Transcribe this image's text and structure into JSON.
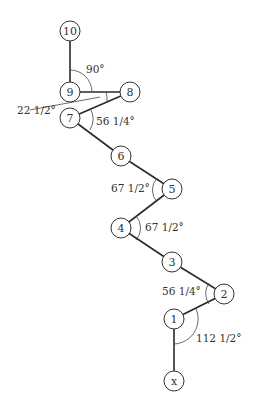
{
  "diagram": {
    "nodes": [
      {
        "id": "10",
        "label": "10",
        "x": 70,
        "y": 31
      },
      {
        "id": "9",
        "label": "9",
        "x": 70,
        "y": 92
      },
      {
        "id": "8",
        "label": "8",
        "x": 130,
        "y": 92
      },
      {
        "id": "7",
        "label": "7",
        "x": 70,
        "y": 118
      },
      {
        "id": "6",
        "label": "6",
        "x": 121,
        "y": 156
      },
      {
        "id": "5",
        "label": "5",
        "x": 172,
        "y": 189
      },
      {
        "id": "4",
        "label": "4",
        "x": 121,
        "y": 228
      },
      {
        "id": "3",
        "label": "3",
        "x": 172,
        "y": 262
      },
      {
        "id": "2",
        "label": "2",
        "x": 224,
        "y": 294
      },
      {
        "id": "1",
        "label": "1",
        "x": 174,
        "y": 319
      },
      {
        "id": "x",
        "label": "x",
        "x": 174,
        "y": 381
      }
    ],
    "edges": [
      [
        "x",
        "1"
      ],
      [
        "1",
        "2"
      ],
      [
        "2",
        "3"
      ],
      [
        "3",
        "4"
      ],
      [
        "4",
        "5"
      ],
      [
        "5",
        "6"
      ],
      [
        "6",
        "7"
      ],
      [
        "7",
        "8"
      ],
      [
        "8",
        "9"
      ],
      [
        "9",
        "10"
      ]
    ],
    "angles": [
      {
        "label": "90°",
        "x": 86,
        "y": 73
      },
      {
        "label": "22 1/2°",
        "x": 17,
        "y": 114
      },
      {
        "label": "56 1/4°",
        "x": 96,
        "y": 125
      },
      {
        "label": "67 1/2°",
        "x": 111,
        "y": 192
      },
      {
        "label": "67 1/2°",
        "x": 145,
        "y": 231
      },
      {
        "label": "56 1/4°",
        "x": 162,
        "y": 295
      },
      {
        "label": "112 1/2°",
        "x": 196,
        "y": 342
      }
    ]
  }
}
